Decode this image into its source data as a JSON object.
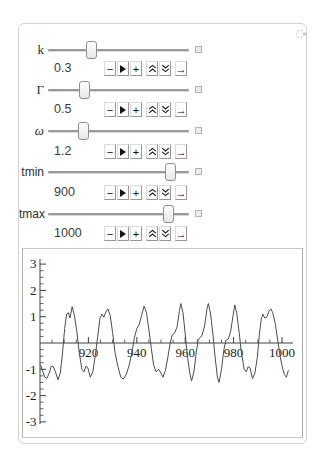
{
  "manipulate": {
    "menu_icon": "manipulate-menu-icon",
    "controls": [
      {
        "label": "k",
        "value": "0.3",
        "thumb_pct": 30.5
      },
      {
        "label": "Γ",
        "value": "0.5",
        "thumb_pct": 25.5
      },
      {
        "label": "ω",
        "value": "1.2",
        "thumb_pct": 24.8
      },
      {
        "label": "tmin",
        "value": "900",
        "thumb_pct": 86.5
      },
      {
        "label": "tmax",
        "value": "1000",
        "thumb_pct": 85.5
      }
    ],
    "stepper": {
      "minus": "−",
      "plus": "+",
      "arrow": "→",
      "play_icon": "play-icon",
      "faster_icon": "double-chevron-up-icon",
      "slower_icon": "double-chevron-down-icon"
    }
  },
  "chart_data": {
    "type": "line",
    "title": "",
    "xlabel": "",
    "ylabel": "",
    "xlim": [
      900,
      1004
    ],
    "ylim": [
      -3,
      3
    ],
    "x_major_ticks": [
      920,
      940,
      960,
      980,
      1000
    ],
    "x_minor_step": 5,
    "y_major_ticks": [
      -3,
      -2,
      -1,
      1,
      2,
      3
    ],
    "y_minor_step": 0.25,
    "grid": false,
    "legend": "none",
    "axis_color": "#3f3f3f",
    "line_color": "#4d4d4d",
    "series": [
      {
        "name": "x(t)",
        "points": [
          [
            900.3,
            -0.85
          ],
          [
            901.2,
            -1.1
          ],
          [
            902,
            -1.3
          ],
          [
            902.8,
            -1.35
          ],
          [
            903.8,
            -1.15
          ],
          [
            904.6,
            -0.9
          ],
          [
            905.4,
            -0.88
          ],
          [
            906.4,
            -1.1
          ],
          [
            907.4,
            -1.4
          ],
          [
            908.4,
            -1.15
          ],
          [
            909.2,
            -0.45
          ],
          [
            910.2,
            0.55
          ],
          [
            911,
            1.1
          ],
          [
            911.7,
            1.15
          ],
          [
            912.4,
            0.95
          ],
          [
            913.3,
            1.38
          ],
          [
            914.2,
            1.05
          ],
          [
            915.2,
            0.45
          ],
          [
            916.2,
            -0.35
          ],
          [
            917.3,
            -1.0
          ],
          [
            918.2,
            -1.1
          ],
          [
            919,
            -0.88
          ],
          [
            919.8,
            -0.95
          ],
          [
            920.8,
            -1.3
          ],
          [
            921.8,
            -1.1
          ],
          [
            922.8,
            -0.5
          ],
          [
            923.8,
            0.2
          ],
          [
            924.8,
            0.95
          ],
          [
            925.6,
            1.1
          ],
          [
            926.4,
            0.98
          ],
          [
            927.2,
            1.18
          ],
          [
            928,
            1.3
          ],
          [
            929,
            1.05
          ],
          [
            930,
            0.4
          ],
          [
            931,
            -0.35
          ],
          [
            932.2,
            -0.9
          ],
          [
            933.4,
            -1.3
          ],
          [
            934.4,
            -1.37
          ],
          [
            935.6,
            -1.2
          ],
          [
            936.8,
            -0.85
          ],
          [
            938,
            -0.35
          ],
          [
            939,
            0.2
          ],
          [
            940,
            0.55
          ],
          [
            941,
            0.7
          ],
          [
            942,
            1.05
          ],
          [
            943,
            1.4
          ],
          [
            944,
            1.15
          ],
          [
            945,
            0.5
          ],
          [
            946,
            -0.2
          ],
          [
            947,
            -0.85
          ],
          [
            948,
            -1.1
          ],
          [
            949,
            -1.0
          ],
          [
            950,
            -1.15
          ],
          [
            950.8,
            -1.3
          ],
          [
            951.8,
            -1.05
          ],
          [
            952.8,
            -0.55
          ],
          [
            953.8,
            0.0
          ],
          [
            954.6,
            0.3
          ],
          [
            955.6,
            0.38
          ],
          [
            956.6,
            0.6
          ],
          [
            957.6,
            1.2
          ],
          [
            958.2,
            1.5
          ],
          [
            959.1,
            1.15
          ],
          [
            960,
            0.35
          ],
          [
            960.8,
            -0.4
          ],
          [
            961.8,
            -1.1
          ],
          [
            962.6,
            -1.45
          ],
          [
            963.6,
            -1.1
          ],
          [
            964.6,
            -0.35
          ],
          [
            965.4,
            0.15
          ],
          [
            966.2,
            0.2
          ],
          [
            967,
            0.3
          ],
          [
            968,
            0.65
          ],
          [
            969,
            1.3
          ],
          [
            969.6,
            1.5
          ],
          [
            970.5,
            1.1
          ],
          [
            971.5,
            0.3
          ],
          [
            972.3,
            -0.5
          ],
          [
            973.3,
            -1.3
          ],
          [
            974,
            -1.5
          ],
          [
            975,
            -1.0
          ],
          [
            976,
            -0.25
          ],
          [
            976.8,
            0.1
          ],
          [
            977.8,
            0.15
          ],
          [
            978.8,
            0.45
          ],
          [
            979.8,
            1.05
          ],
          [
            980.5,
            1.45
          ],
          [
            981.3,
            1.15
          ],
          [
            982.3,
            0.4
          ],
          [
            983.2,
            -0.35
          ],
          [
            984.4,
            -1.0
          ],
          [
            985.2,
            -1.1
          ],
          [
            986,
            -0.9
          ],
          [
            986.8,
            -0.95
          ],
          [
            987.8,
            -1.35
          ],
          [
            988.8,
            -1.15
          ],
          [
            989.8,
            -0.55
          ],
          [
            990.6,
            0.3
          ],
          [
            991.4,
            0.9
          ],
          [
            992.1,
            1.1
          ],
          [
            992.9,
            0.95
          ],
          [
            993.7,
            0.98
          ],
          [
            994.6,
            1.2
          ],
          [
            995.4,
            1.3
          ],
          [
            996.2,
            1.15
          ],
          [
            997.2,
            0.75
          ],
          [
            998.2,
            0.15
          ],
          [
            999.2,
            -0.5
          ],
          [
            1000.2,
            -0.95
          ],
          [
            1001,
            -1.2
          ],
          [
            1001.8,
            -1.3
          ],
          [
            1002.6,
            -1.05
          ]
        ]
      }
    ]
  }
}
